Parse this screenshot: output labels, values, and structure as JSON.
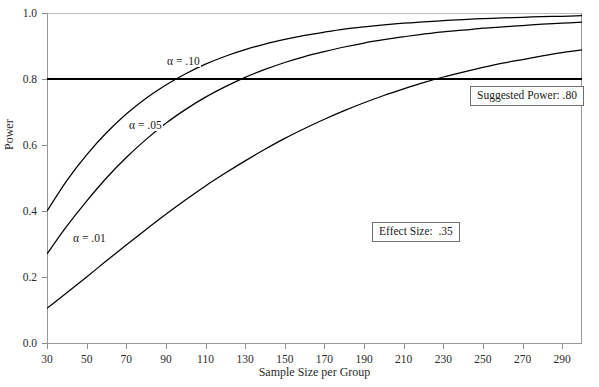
{
  "chart_data": {
    "type": "line",
    "title": "",
    "xlabel": "Sample Size per Group",
    "ylabel": "Power",
    "xlim": [
      30,
      300
    ],
    "ylim": [
      0.0,
      1.0
    ],
    "grid": false,
    "legend_position": "inline-curve-labels",
    "xticks": [
      30,
      50,
      70,
      90,
      110,
      130,
      150,
      170,
      190,
      210,
      230,
      250,
      270,
      290
    ],
    "xtick_labels": [
      "30",
      "50",
      "70",
      "90",
      "110",
      "130",
      "150",
      "170",
      "190",
      "210",
      "230",
      "250",
      "270",
      "290"
    ],
    "yticks": [
      0.0,
      0.2,
      0.4,
      0.6,
      0.8,
      1.0
    ],
    "ytick_labels": [
      "0.0",
      "0.2",
      "0.4",
      "0.6",
      "0.8",
      "1.0"
    ],
    "x": [
      30,
      40,
      50,
      60,
      70,
      80,
      90,
      100,
      110,
      120,
      130,
      140,
      150,
      160,
      170,
      180,
      190,
      200,
      210,
      220,
      230,
      240,
      250,
      260,
      270,
      280,
      290,
      300
    ],
    "series": [
      {
        "name": "alpha = .10",
        "label": "α = .10",
        "alpha": 0.1,
        "color": "#000000",
        "values": [
          0.4,
          0.492,
          0.57,
          0.637,
          0.694,
          0.742,
          0.782,
          0.816,
          0.845,
          0.869,
          0.889,
          0.906,
          0.92,
          0.932,
          0.942,
          0.951,
          0.958,
          0.964,
          0.969,
          0.973,
          0.977,
          0.98,
          0.983,
          0.985,
          0.987,
          0.989,
          0.99,
          0.992
        ]
      },
      {
        "name": "alpha = .05",
        "label": "α = .05",
        "alpha": 0.05,
        "color": "#000000",
        "values": [
          0.27,
          0.354,
          0.43,
          0.5,
          0.562,
          0.617,
          0.666,
          0.708,
          0.745,
          0.777,
          0.805,
          0.829,
          0.85,
          0.868,
          0.883,
          0.897,
          0.909,
          0.919,
          0.928,
          0.936,
          0.943,
          0.948,
          0.954,
          0.958,
          0.962,
          0.966,
          0.969,
          0.972
        ]
      },
      {
        "name": "alpha = .01",
        "label": "α = .01",
        "alpha": 0.01,
        "color": "#000000",
        "values": [
          0.105,
          0.152,
          0.2,
          0.249,
          0.297,
          0.344,
          0.39,
          0.434,
          0.476,
          0.515,
          0.552,
          0.587,
          0.62,
          0.65,
          0.678,
          0.704,
          0.728,
          0.75,
          0.77,
          0.789,
          0.806,
          0.821,
          0.835,
          0.848,
          0.859,
          0.87,
          0.88,
          0.888
        ]
      }
    ],
    "reference_lines": [
      {
        "name": "suggested-power",
        "orientation": "horizontal",
        "value": 0.8,
        "color": "#000000"
      }
    ],
    "annotations": [
      {
        "name": "suggested-power",
        "text": "Suggested Power: .80"
      },
      {
        "name": "effect-size",
        "text": "Effect Size:  .35"
      }
    ]
  }
}
